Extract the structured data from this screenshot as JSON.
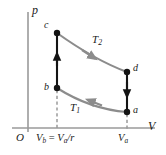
{
  "figure": {
    "name": "carnot-cycle-pv-diagram",
    "axes": {
      "y_label": "p",
      "x_label": "V",
      "origin_label": "O",
      "axis_color": "#9a9a9a"
    },
    "ticks": [
      {
        "name": "vb",
        "label_main": "V",
        "label_sub": "b",
        "equals": " = ",
        "label_main2": "V",
        "label_sub2": "a",
        "divisor": "/r",
        "x": 57
      },
      {
        "name": "va",
        "label_main": "V",
        "label_sub": "a",
        "x": 127
      }
    ],
    "points": [
      {
        "id": "c",
        "label": "c",
        "x": 57,
        "y": 33
      },
      {
        "id": "b",
        "label": "b",
        "x": 57,
        "y": 88
      },
      {
        "id": "d",
        "label": "d",
        "x": 127,
        "y": 72
      },
      {
        "id": "a",
        "label": "a",
        "x": 127,
        "y": 112
      }
    ],
    "isotherms": [
      {
        "id": "T2",
        "label_main": "T",
        "label_sub": "2",
        "from": "c",
        "to": "d",
        "color": "#8c8c8c",
        "direction": "rightward"
      },
      {
        "id": "T1",
        "label_main": "T",
        "label_sub": "1",
        "from": "a",
        "to": "b",
        "color": "#8c8c8c",
        "direction": "leftward"
      }
    ],
    "adiabats": [
      {
        "id": "bc",
        "from": "b",
        "to": "c",
        "color": "#141414",
        "direction": "upward"
      },
      {
        "id": "da",
        "from": "d",
        "to": "a",
        "color": "#141414",
        "direction": "downward"
      }
    ],
    "colors": {
      "curve_gray": "#8c8c8c",
      "line_black": "#141414",
      "axis_gray": "#9a9a9a",
      "dashed_gray": "#9a9a9a",
      "text": "#1a1a1a",
      "background": "#ffffff"
    }
  }
}
